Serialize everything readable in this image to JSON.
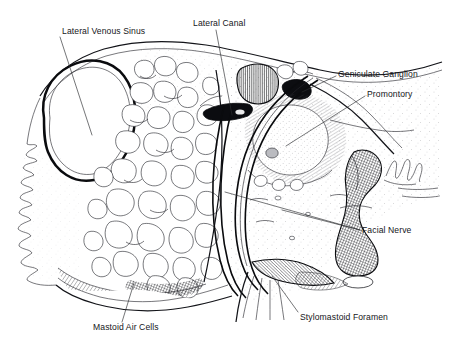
{
  "figure": {
    "background_color": "#ffffff",
    "ink_color": "#111216",
    "label_color": "#15161a"
  },
  "labels": [
    {
      "id": "lateral-venous-sinus",
      "text": "Lateral Venous Sinus",
      "x": 62,
      "y": 34,
      "anchor": "start"
    },
    {
      "id": "lateral-canal",
      "text": "Lateral Canal",
      "x": 193,
      "y": 26,
      "anchor": "start"
    },
    {
      "id": "geniculate-ganglion",
      "text": "Geniculate Ganglion",
      "x": 338,
      "y": 77,
      "anchor": "start"
    },
    {
      "id": "promontory",
      "text": "Promontory",
      "x": 367,
      "y": 97,
      "anchor": "start"
    },
    {
      "id": "facial-nerve",
      "text": "Facial Nerve",
      "x": 362,
      "y": 233,
      "anchor": "start"
    },
    {
      "id": "stylomastoid-foramen",
      "text": "Stylomastoid Foramen",
      "x": 300,
      "y": 320,
      "anchor": "start"
    },
    {
      "id": "mastoid-air-cells",
      "text": "Mastoid Air Cells",
      "x": 93,
      "y": 330,
      "anchor": "start"
    }
  ],
  "structures": [
    {
      "id": "lateral-venous-sinus-lumen",
      "name": "Lateral Venous Sinus",
      "kind": "vessel-lumen"
    },
    {
      "id": "mastoid-air-cell-field",
      "name": "Mastoid Air Cells",
      "kind": "air-cell-honeycomb"
    },
    {
      "id": "lateral-semicircular-canal",
      "name": "Lateral Canal",
      "kind": "canal"
    },
    {
      "id": "geniculate-ganglion-body",
      "name": "Geniculate Ganglion",
      "kind": "ganglion"
    },
    {
      "id": "promontory-body",
      "name": "Promontory",
      "kind": "bony-prominence"
    },
    {
      "id": "facial-nerve-canal",
      "name": "Facial Nerve",
      "kind": "nerve-canal"
    },
    {
      "id": "stylomastoid-foramen-opening",
      "name": "Stylomastoid Foramen",
      "kind": "foramen"
    }
  ]
}
